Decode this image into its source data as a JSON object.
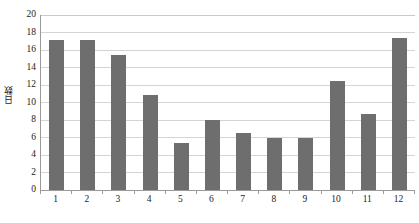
{
  "chart_data": {
    "type": "bar",
    "title": "",
    "xlabel": "月",
    "ylabel": "日数",
    "categories": [
      "1",
      "2",
      "3",
      "4",
      "5",
      "6",
      "7",
      "8",
      "9",
      "10",
      "11",
      "12"
    ],
    "values": [
      17.1,
      17.1,
      15.4,
      10.9,
      5.4,
      8.0,
      6.5,
      6.0,
      6.0,
      12.5,
      8.7,
      17.4
    ],
    "ylim": [
      0,
      20
    ],
    "ytick_step": 2,
    "yticks": [
      "0",
      "2",
      "4",
      "6",
      "8",
      "10",
      "12",
      "14",
      "16",
      "18",
      "20"
    ],
    "grid": true,
    "legend": "none",
    "series": [
      {
        "name": "日数",
        "values": [
          17.1,
          17.1,
          15.4,
          10.9,
          5.4,
          8.0,
          6.5,
          6.0,
          6.0,
          12.5,
          8.7,
          17.4
        ]
      }
    ]
  },
  "colors": {
    "bar": "#6e6e6e",
    "gridline": "#d4d4d4",
    "axis": "#9a9a9a",
    "background": "#ffffff",
    "text": "#1a1a1a"
  }
}
